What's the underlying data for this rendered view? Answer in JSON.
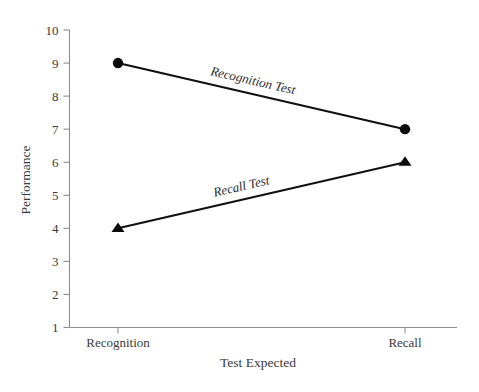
{
  "chart_data": {
    "type": "line",
    "title": "",
    "subtitle": "",
    "xlabel": "Test Expected",
    "ylabel": "Performance",
    "categories": [
      "Recognition",
      "Recall"
    ],
    "x": [
      0,
      1
    ],
    "ylim": [
      1,
      10
    ],
    "yticks": [
      1,
      2,
      3,
      4,
      5,
      6,
      7,
      8,
      9,
      10
    ],
    "ytick_labels": [
      "1",
      "2",
      "3",
      "4",
      "5",
      "6",
      "7",
      "8",
      "9",
      "10"
    ],
    "xtick_labels": [
      "Recognition",
      "Recall"
    ],
    "grid": false,
    "legend_position": "inline-on-line",
    "series": [
      {
        "name": "Recognition Test",
        "label": "Recognition Test",
        "marker": "circle",
        "values": [
          9,
          7
        ],
        "color": "#0b0b0b"
      },
      {
        "name": "Recall Test",
        "label": "Recall Test",
        "marker": "triangle",
        "values": [
          4,
          6
        ],
        "color": "#0b0b0b"
      }
    ],
    "annotations": [
      {
        "text": "Recognition Test",
        "series": "Recognition Test"
      },
      {
        "text": "Recall Test",
        "series": "Recall Test"
      }
    ],
    "colors": {
      "background": "#ffffff",
      "line": "#0b0b0b",
      "axis": "#8d8d8d",
      "text": "#3a3a3a"
    }
  },
  "axes": {
    "y_title": "Performance",
    "x_title": "Test Expected",
    "y_ticks": [
      {
        "value": 10,
        "label": "10"
      },
      {
        "value": 9,
        "label": "9"
      },
      {
        "value": 8,
        "label": "8"
      },
      {
        "value": 7,
        "label": "7"
      },
      {
        "value": 6,
        "label": "6"
      },
      {
        "value": 5,
        "label": "5"
      },
      {
        "value": 4,
        "label": "4"
      },
      {
        "value": 3,
        "label": "3"
      },
      {
        "value": 2,
        "label": "2"
      },
      {
        "value": 1,
        "label": "1"
      }
    ],
    "x_ticks": [
      {
        "value": 0,
        "label": "Recognition"
      },
      {
        "value": 1,
        "label": "Recall"
      }
    ]
  },
  "series_labels": {
    "recognition": "Recognition Test",
    "recall": "Recall Test"
  }
}
